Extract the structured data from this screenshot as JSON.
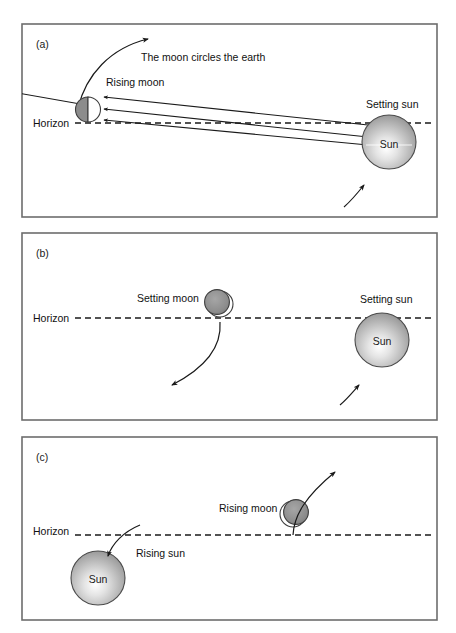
{
  "figure": {
    "background_color": "#ffffff",
    "border_color": "#6d6d6d",
    "ink_color": "#1a1a1a"
  },
  "panels": [
    {
      "tag": "(a)",
      "horizon_label": "Horizon",
      "labels": {
        "orbit_note": "The moon circles the earth",
        "moon": "Rising moon",
        "sun": "Setting sun",
        "sun_body": "Sun"
      },
      "moon_phase": "half-lit-right",
      "ray_count": 3,
      "description": "Rising moon on the horizon at left, setting sun at right, three light rays travel from the sun to the moon"
    },
    {
      "tag": "(b)",
      "horizon_label": "Horizon",
      "labels": {
        "moon": "Setting moon",
        "sun": "Setting sun",
        "sun_body": "Sun"
      },
      "moon_phase": "nearly-dark-crescent-right",
      "description": "Setting moon near the middle of the horizon and setting sun at right, both moving downward"
    },
    {
      "tag": "(c)",
      "horizon_label": "Horizon",
      "labels": {
        "moon": "Rising moon",
        "sun": "Rising sun",
        "sun_body": "Sun"
      },
      "moon_phase": "nearly-dark-crescent-left",
      "description": "Rising sun at lower left crossing the horizon and rising moon at right moving upward"
    }
  ]
}
